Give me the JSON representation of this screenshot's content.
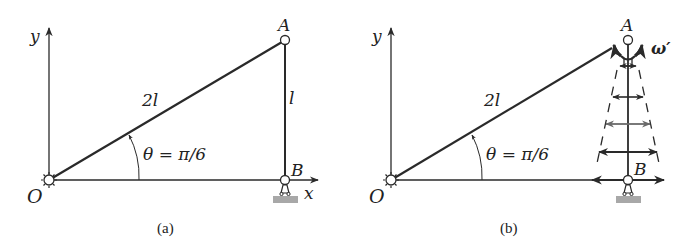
{
  "panels": [
    {
      "id": "a",
      "caption": "(a)",
      "labels": {
        "y_axis": "y",
        "x_axis": "x",
        "origin": "O",
        "point_a": "A",
        "point_b": "B",
        "link_oa": "2l",
        "link_ab": "l",
        "angle": "θ = π/6"
      }
    },
    {
      "id": "b",
      "caption": "(b)",
      "labels": {
        "y_axis": "y",
        "origin": "O",
        "point_a": "A",
        "point_b": "B",
        "link_oa": "2l",
        "angle": "θ = π/6",
        "angular_velocity": "ω′"
      }
    }
  ],
  "colors": {
    "line": "#2a2a2a",
    "ground": "#a8a8a8",
    "velocity_light": "#6a6a6a"
  }
}
